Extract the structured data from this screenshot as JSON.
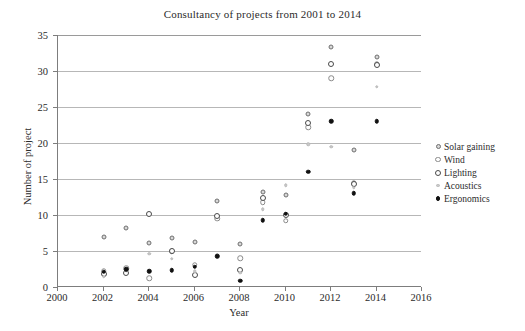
{
  "chart_data": {
    "type": "scatter",
    "title": "Consultancy of projects from 2001 to 2014",
    "xlabel": "Year",
    "ylabel": "Number of project",
    "xlim": [
      2000,
      2016
    ],
    "ylim": [
      0,
      35
    ],
    "xticks": [
      2000,
      2002,
      2004,
      2006,
      2008,
      2010,
      2012,
      2014,
      2016
    ],
    "yticks": [
      0,
      5,
      10,
      15,
      20,
      25,
      30,
      35
    ],
    "grid": "horizontal",
    "legend_position": "right",
    "series": [
      {
        "name": "Solar gaining",
        "marker": "small-grey-filled-circle",
        "color": "#d8d8d8",
        "points": [
          {
            "x": 2002,
            "y": 7.0
          },
          {
            "x": 2003,
            "y": 8.2
          },
          {
            "x": 2004,
            "y": 6.1
          },
          {
            "x": 2005,
            "y": 6.8
          },
          {
            "x": 2006,
            "y": 6.3
          },
          {
            "x": 2007,
            "y": 12.0
          },
          {
            "x": 2008,
            "y": 6.0
          },
          {
            "x": 2009,
            "y": 13.2
          },
          {
            "x": 2010,
            "y": 12.8
          },
          {
            "x": 2011,
            "y": 24.0
          },
          {
            "x": 2012,
            "y": 33.3
          },
          {
            "x": 2013,
            "y": 19.0
          },
          {
            "x": 2014,
            "y": 32.0
          }
        ]
      },
      {
        "name": "Wind",
        "marker": "open-grey-circle",
        "color": "#fdfdfd",
        "points": [
          {
            "x": 2002,
            "y": 2.2
          },
          {
            "x": 2003,
            "y": 2.6
          },
          {
            "x": 2004,
            "y": 1.2
          },
          {
            "x": 2005,
            "y": 5.0
          },
          {
            "x": 2006,
            "y": 3.1
          },
          {
            "x": 2007,
            "y": 9.5
          },
          {
            "x": 2008,
            "y": 4.0
          },
          {
            "x": 2009,
            "y": 11.8
          },
          {
            "x": 2010,
            "y": 9.2
          },
          {
            "x": 2011,
            "y": 22.2
          },
          {
            "x": 2012,
            "y": 29.0
          },
          {
            "x": 2013,
            "y": 14.5
          },
          {
            "x": 2014,
            "y": 31.0
          }
        ]
      },
      {
        "name": "Lighting",
        "marker": "open-dark-circle",
        "color": "#ffffff",
        "points": [
          {
            "x": 2002,
            "y": 1.8
          },
          {
            "x": 2003,
            "y": 2.0
          },
          {
            "x": 2004,
            "y": 10.1
          },
          {
            "x": 2005,
            "y": 5.0
          },
          {
            "x": 2006,
            "y": 1.7
          },
          {
            "x": 2007,
            "y": 9.9
          },
          {
            "x": 2008,
            "y": 2.4
          },
          {
            "x": 2009,
            "y": 12.4
          },
          {
            "x": 2010,
            "y": 10.0
          },
          {
            "x": 2011,
            "y": 22.8
          },
          {
            "x": 2012,
            "y": 31.0
          },
          {
            "x": 2013,
            "y": 14.3
          },
          {
            "x": 2014,
            "y": 30.9
          }
        ]
      },
      {
        "name": "Acoustics",
        "marker": "tiny-light-grey-dot",
        "color": "#c9c9c9",
        "points": [
          {
            "x": 2002,
            "y": 1.4
          },
          {
            "x": 2003,
            "y": 2.3
          },
          {
            "x": 2004,
            "y": 4.6
          },
          {
            "x": 2005,
            "y": 3.9
          },
          {
            "x": 2006,
            "y": 2.2
          },
          {
            "x": 2007,
            "y": 4.4
          },
          {
            "x": 2008,
            "y": 2.0
          },
          {
            "x": 2009,
            "y": 10.8
          },
          {
            "x": 2010,
            "y": 14.1
          },
          {
            "x": 2011,
            "y": 19.8
          },
          {
            "x": 2012,
            "y": 19.5
          },
          {
            "x": 2013,
            "y": 13.8
          },
          {
            "x": 2014,
            "y": 27.8
          }
        ]
      },
      {
        "name": "Ergonomics",
        "marker": "small-black-filled-circle",
        "color": "#111111",
        "points": [
          {
            "x": 2002,
            "y": 2.1
          },
          {
            "x": 2003,
            "y": 2.5
          },
          {
            "x": 2004,
            "y": 2.2
          },
          {
            "x": 2005,
            "y": 2.3
          },
          {
            "x": 2006,
            "y": 2.8
          },
          {
            "x": 2007,
            "y": 4.3
          },
          {
            "x": 2008,
            "y": 0.9
          },
          {
            "x": 2009,
            "y": 9.3
          },
          {
            "x": 2010,
            "y": 10.2
          },
          {
            "x": 2011,
            "y": 16.0
          },
          {
            "x": 2012,
            "y": 23.0
          },
          {
            "x": 2013,
            "y": 13.0
          },
          {
            "x": 2014,
            "y": 23.0
          }
        ]
      }
    ]
  }
}
